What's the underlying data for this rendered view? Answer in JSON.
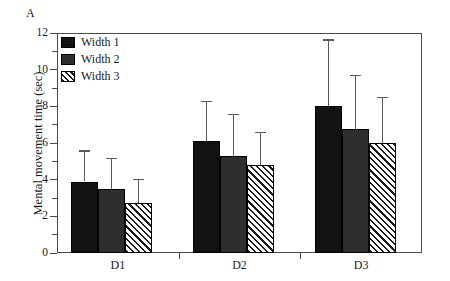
{
  "panel": {
    "label": "A"
  },
  "chart_data": {
    "type": "bar",
    "title": "",
    "subtitle": "",
    "xlabel": "",
    "ylabel": "Mental movement time (sec)",
    "categories": [
      "D1",
      "D2",
      "D3"
    ],
    "series": [
      {
        "name": "Width 1",
        "color": "#121212",
        "fill": "solid-black",
        "values": [
          3.9,
          6.1,
          8.0
        ],
        "errors_upper": [
          5.6,
          8.3,
          11.65
        ]
      },
      {
        "name": "Width 2",
        "color": "#2e2e2e",
        "fill": "solid-gray",
        "values": [
          3.5,
          5.3,
          6.75
        ],
        "errors_upper": [
          5.2,
          7.6,
          9.7
        ]
      },
      {
        "name": "Width 3",
        "color": "#1a1a1a",
        "fill": "diagonal-hatch",
        "values": [
          2.75,
          4.8,
          6.0
        ],
        "errors_upper": [
          4.05,
          6.6,
          8.5
        ]
      }
    ],
    "ylim": [
      0,
      12
    ],
    "ytick_major": [
      0,
      2,
      4,
      6,
      8,
      10,
      12
    ],
    "ytick_minor": [
      1,
      3,
      5,
      7,
      9,
      11
    ],
    "ytick_labels": [
      "0",
      "2",
      "4",
      "6",
      "8",
      "10",
      "12"
    ],
    "grid": false,
    "legend_position": "top-left",
    "error_bar_style": "upper-only-with-cap"
  },
  "legend": {
    "entries": [
      {
        "label": "Width 1"
      },
      {
        "label": "Width 2"
      },
      {
        "label": "Width 3"
      }
    ]
  }
}
